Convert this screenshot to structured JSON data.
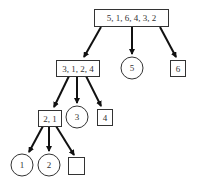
{
  "diagram": {
    "type": "tree",
    "nodes": [
      {
        "id": "root",
        "label": "5, 1, 6, 4, 3, 2",
        "shape": "box"
      },
      {
        "id": "n3124",
        "label": "3, 1, 2, 4",
        "shape": "box"
      },
      {
        "id": "n5",
        "label": "5",
        "shape": "circle"
      },
      {
        "id": "n6",
        "label": "6",
        "shape": "box"
      },
      {
        "id": "n21",
        "label": "2, 1",
        "shape": "box"
      },
      {
        "id": "n3",
        "label": "3",
        "shape": "circle"
      },
      {
        "id": "n4",
        "label": "4",
        "shape": "box"
      },
      {
        "id": "n1",
        "label": "1",
        "shape": "circle"
      },
      {
        "id": "n2",
        "label": "2",
        "shape": "circle"
      },
      {
        "id": "nempty",
        "label": "",
        "shape": "box"
      }
    ],
    "edges": [
      [
        "root",
        "n3124"
      ],
      [
        "root",
        "n5"
      ],
      [
        "root",
        "n6"
      ],
      [
        "n3124",
        "n21"
      ],
      [
        "n3124",
        "n3"
      ],
      [
        "n3124",
        "n4"
      ],
      [
        "n21",
        "n1"
      ],
      [
        "n21",
        "n2"
      ],
      [
        "n21",
        "nempty"
      ]
    ]
  }
}
